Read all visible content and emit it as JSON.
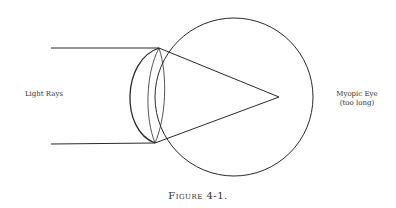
{
  "figure": {
    "caption": "Figure 4-1.",
    "labels": {
      "light_rays": "Light Rays",
      "eye_title": "Myopic Eye",
      "eye_subtitle": "(too long)"
    },
    "colors": {
      "stroke": "#2a2a2a",
      "background": "#ffffff"
    },
    "geometry": {
      "eyeball": {
        "cx": 234,
        "cy": 97,
        "r": 79
      },
      "top_ray": {
        "x1": 51,
        "y1": 48,
        "x2": 159,
        "y2": 48
      },
      "bottom_ray": {
        "x1": 51,
        "y1": 144,
        "x2": 155,
        "y2": 143
      },
      "focal_point": {
        "x": 279,
        "y": 97
      }
    }
  }
}
